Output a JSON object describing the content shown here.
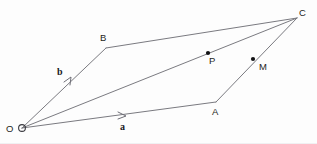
{
  "figure": {
    "background_color": "#fdfdfd",
    "line_color": "#7a7a80",
    "label_color": "#1d1d22",
    "dot_color": "#121214",
    "width": 317,
    "height": 144
  },
  "labels": {
    "origin": "O",
    "vertex_a": "A",
    "vertex_b": "B",
    "vertex_c": "C",
    "point_p": "P",
    "point_m": "M",
    "vector_a": "a",
    "vector_b": "b"
  },
  "geometry": {
    "points": [
      {
        "name": "O",
        "x": 22,
        "y": 128,
        "kind": "ring"
      },
      {
        "name": "A",
        "x": 216,
        "y": 102,
        "kind": "plain"
      },
      {
        "name": "B",
        "x": 106,
        "y": 48,
        "kind": "plain"
      },
      {
        "name": "C",
        "x": 297,
        "y": 18,
        "kind": "plain"
      },
      {
        "name": "P",
        "x": 208,
        "y": 53,
        "kind": "dot"
      },
      {
        "name": "M",
        "x": 253,
        "y": 59,
        "kind": "dot"
      }
    ],
    "segments": [
      {
        "name": "O-B",
        "from": "O",
        "to": "B"
      },
      {
        "name": "O-A",
        "from": "O",
        "to": "A"
      },
      {
        "name": "O-C",
        "from": "O",
        "to": "C"
      },
      {
        "name": "B-C",
        "from": "B",
        "to": "C"
      },
      {
        "name": "A-C",
        "from": "A",
        "to": "C"
      }
    ],
    "arrow_markers": [
      {
        "name": "vector-b-arrow",
        "on": "O-B",
        "x": 71,
        "y": 82
      },
      {
        "name": "vector-a-arrow",
        "on": "O-A",
        "x": 124,
        "y": 116
      }
    ],
    "label_positions": {
      "O": {
        "x": 6,
        "y": 124
      },
      "A": {
        "x": 212,
        "y": 107
      },
      "B": {
        "x": 100,
        "y": 33
      },
      "C": {
        "x": 299,
        "y": 8
      },
      "P": {
        "x": 209,
        "y": 56
      },
      "M": {
        "x": 259,
        "y": 62
      },
      "a": {
        "x": 120,
        "y": 122
      },
      "b": {
        "x": 57,
        "y": 67
      }
    }
  }
}
